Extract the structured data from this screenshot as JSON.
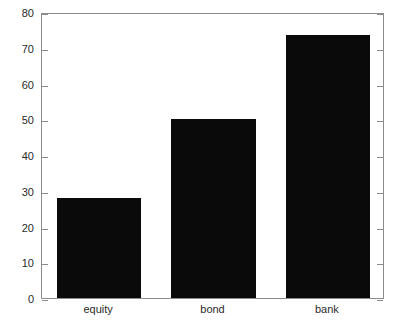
{
  "chart_data": {
    "type": "bar",
    "title": "",
    "xlabel": "",
    "ylabel": "",
    "categories": [
      "equity",
      "bond",
      "bank"
    ],
    "values": [
      28,
      50,
      73.5
    ],
    "series": [
      {
        "name": "value",
        "values": [
          28,
          50,
          73.5
        ]
      }
    ],
    "ylim": [
      0,
      80
    ],
    "yticks": [
      0,
      10,
      20,
      30,
      40,
      50,
      60,
      70,
      80
    ],
    "ytick_labels": [
      "0",
      "10",
      "20",
      "30",
      "40",
      "50",
      "60",
      "70",
      "80"
    ],
    "xticks": [
      "equity",
      "bond",
      "bank"
    ],
    "grid": false,
    "legend": null,
    "legend_position": "none",
    "bar_color": "#0a0a0a",
    "axis_color": "#8c8c8c",
    "text_color": "#2b2b2b",
    "background": "#ffffff"
  }
}
